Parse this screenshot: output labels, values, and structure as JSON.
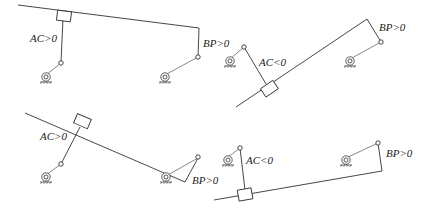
{
  "diagram": {
    "colors": {
      "line": "#333333",
      "background": "#ffffff"
    },
    "panels": [
      {
        "id": "top-left",
        "ac_label": "AC>0",
        "bp_label": "BP>0"
      },
      {
        "id": "top-right",
        "ac_label": "AC<0",
        "bp_label": "BP>0"
      },
      {
        "id": "bottom-left",
        "ac_label": "AC>0",
        "bp_label": "BP>0"
      },
      {
        "id": "bottom-right",
        "ac_label": "AC<0",
        "bp_label": "BP>0"
      }
    ]
  }
}
